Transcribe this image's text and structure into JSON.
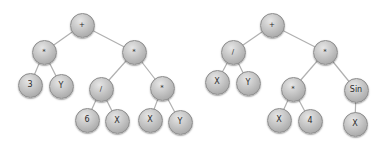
{
  "diagram": {
    "type": "expression-trees",
    "colors": {
      "node": "#bdbdbd",
      "edge": "#b0b0b0",
      "text": "#2a2a2a",
      "background": "#ffffff"
    },
    "trees": [
      {
        "id": "left",
        "nodes": [
          {
            "id": "L0",
            "label": "+",
            "x": 82,
            "y": 25
          },
          {
            "id": "L1",
            "label": "*",
            "x": 44,
            "y": 52
          },
          {
            "id": "L2",
            "label": "*",
            "x": 134,
            "y": 52
          },
          {
            "id": "L3",
            "label": "3",
            "x": 30,
            "y": 85
          },
          {
            "id": "L4",
            "label": "Y",
            "x": 61,
            "y": 86
          },
          {
            "id": "L5",
            "label": "/",
            "x": 101,
            "y": 89
          },
          {
            "id": "L6",
            "label": "*",
            "x": 162,
            "y": 88
          },
          {
            "id": "L7",
            "label": "6",
            "x": 87,
            "y": 120
          },
          {
            "id": "L8",
            "label": "X",
            "x": 117,
            "y": 121
          },
          {
            "id": "L9",
            "label": "X",
            "x": 150,
            "y": 120
          },
          {
            "id": "L10",
            "label": "Y",
            "x": 180,
            "y": 122
          }
        ],
        "edges": [
          [
            "L0",
            "L1"
          ],
          [
            "L0",
            "L2"
          ],
          [
            "L1",
            "L3"
          ],
          [
            "L1",
            "L4"
          ],
          [
            "L2",
            "L5"
          ],
          [
            "L2",
            "L6"
          ],
          [
            "L5",
            "L7"
          ],
          [
            "L5",
            "L8"
          ],
          [
            "L6",
            "L9"
          ],
          [
            "L6",
            "L10"
          ]
        ]
      },
      {
        "id": "right",
        "nodes": [
          {
            "id": "R0",
            "label": "+",
            "x": 272,
            "y": 25
          },
          {
            "id": "R1",
            "label": "/",
            "x": 233,
            "y": 52
          },
          {
            "id": "R2",
            "label": "*",
            "x": 325,
            "y": 52
          },
          {
            "id": "R3",
            "label": "X",
            "x": 217,
            "y": 82
          },
          {
            "id": "R4",
            "label": "Y",
            "x": 248,
            "y": 83
          },
          {
            "id": "R5",
            "label": "*",
            "x": 293,
            "y": 89
          },
          {
            "id": "R6",
            "label": "Sin",
            "x": 356,
            "y": 90
          },
          {
            "id": "R7",
            "label": "X",
            "x": 279,
            "y": 120
          },
          {
            "id": "R8",
            "label": "4",
            "x": 310,
            "y": 121
          },
          {
            "id": "R9",
            "label": "X",
            "x": 355,
            "y": 124
          }
        ],
        "edges": [
          [
            "R0",
            "R1"
          ],
          [
            "R0",
            "R2"
          ],
          [
            "R1",
            "R3"
          ],
          [
            "R1",
            "R4"
          ],
          [
            "R2",
            "R5"
          ],
          [
            "R2",
            "R6"
          ],
          [
            "R5",
            "R7"
          ],
          [
            "R5",
            "R8"
          ],
          [
            "R6",
            "R9"
          ]
        ]
      }
    ]
  }
}
